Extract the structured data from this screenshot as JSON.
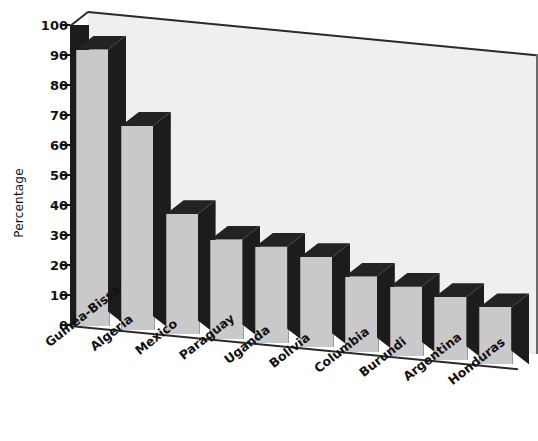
{
  "chart_data": {
    "type": "bar",
    "title": "",
    "xlabel": "",
    "ylabel": "Percentage",
    "ylim": [
      0,
      100
    ],
    "ytick_step": 10,
    "grid": false,
    "legend": "none",
    "style": "3d-column",
    "categories": [
      "Guinea-Bissau",
      "Algeria",
      "Mexico",
      "Paraguay",
      "Uganda",
      "Bolivia",
      "Columbia",
      "Burundi",
      "Argentina",
      "Honduras"
    ],
    "values": [
      92,
      68,
      40,
      33,
      32,
      30,
      25,
      23,
      21,
      19
    ],
    "ytick_labels": [
      "0",
      "10",
      "20",
      "30",
      "40",
      "50",
      "60",
      "70",
      "80",
      "90",
      "100"
    ]
  },
  "colors": {
    "bar_face": "#c9c9c9",
    "bar_shadow": "#1c1c1c",
    "back_wall": "#efefef",
    "axis": "#111111",
    "page_background": "#ffffff"
  }
}
